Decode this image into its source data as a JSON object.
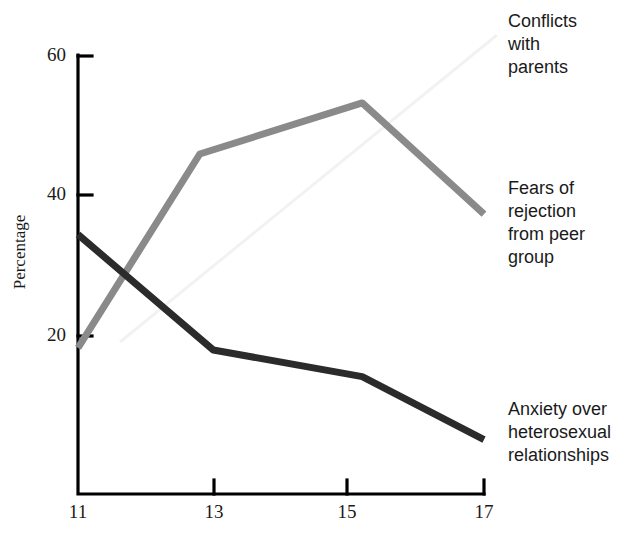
{
  "chart_data": {
    "type": "line",
    "title": "",
    "subtitle": "",
    "xlabel": "",
    "ylabel": "Percentage",
    "x": [
      11,
      13,
      15,
      17
    ],
    "xticklabels": [
      "11",
      "13",
      "15",
      "17"
    ],
    "yticklabels": [
      "20",
      "40",
      "60"
    ],
    "xlim": [
      11,
      17
    ],
    "ylim": [
      0,
      60
    ],
    "yticks": [
      20,
      40,
      60
    ],
    "grid": false,
    "legend_position": "right-inline-labels",
    "series": [
      {
        "name": "Conflicts with parents",
        "color": "#8a8a8a",
        "points": [
          {
            "x": 11.0,
            "y": 18.3
          },
          {
            "x": 12.8,
            "y": 46.0
          },
          {
            "x": 15.2,
            "y": 53.3
          },
          {
            "x": 17.0,
            "y": 37.4
          }
        ],
        "values": [
          18.3,
          46.0,
          53.3,
          37.4
        ]
      },
      {
        "name": "Anxiety over heterosexual relationships",
        "color": "#2b2b2b",
        "points": [
          {
            "x": 11.0,
            "y": 34.5
          },
          {
            "x": 13.0,
            "y": 18.0
          },
          {
            "x": 15.2,
            "y": 14.2
          },
          {
            "x": 17.0,
            "y": 5.2
          }
        ],
        "values": [
          34.5,
          18.0,
          14.2,
          5.2
        ]
      }
    ],
    "annotations": [
      {
        "text": "Conflicts with parents",
        "target_series": "Conflicts with parents"
      },
      {
        "text": "Fears of rejection from peer group",
        "target_series": "Fears of rejection from peer group"
      },
      {
        "text": "Anxiety over heterosexual relationships",
        "target_series": "Anxiety over heterosexual relationships"
      }
    ]
  },
  "axis": {
    "y_ticks": [
      {
        "label": "60",
        "value": 60
      },
      {
        "label": "40",
        "value": 40
      },
      {
        "label": "20",
        "value": 20
      }
    ],
    "x_ticks": [
      {
        "label": "11",
        "value": 11
      },
      {
        "label": "13",
        "value": 13
      },
      {
        "label": "15",
        "value": 15
      },
      {
        "label": "17",
        "value": 17
      }
    ],
    "y_axis_title": "Percentage"
  },
  "labels": {
    "conflicts": "Conflicts\nwith\nparents",
    "conflicts_line1": "Conflicts",
    "conflicts_line2": "with",
    "conflicts_line3": "parents",
    "fears_line1": "Fears of",
    "fears_line2": "rejection",
    "fears_line3": "from peer",
    "fears_line4": "group",
    "anxiety_line1": "Anxiety over",
    "anxiety_line2": "heterosexual",
    "anxiety_line3": "relationships"
  },
  "colors": {
    "gray_series": "#8a8a8a",
    "dark_series": "#2b2b2b",
    "axis": "#000000",
    "background": "#ffffff"
  }
}
